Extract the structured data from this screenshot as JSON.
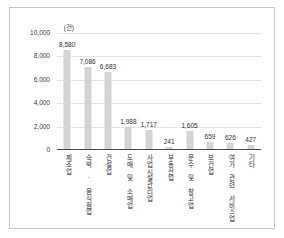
{
  "chart_data": {
    "type": "bar",
    "title": "",
    "subtitle": "",
    "xlabel": "",
    "ylabel": "",
    "unit_label": "(건)",
    "ylim": [
      0,
      10000
    ],
    "ytick_labels": [
      "10,000",
      "8,000",
      "6,000",
      "4,000",
      "2,000",
      "0"
    ],
    "ytick_values": [
      10000,
      8000,
      6000,
      4000,
      2000,
      0
    ],
    "grid": true,
    "legend": false,
    "bar_color": "#d4d4d4",
    "categories": [
      "제조업",
      "숙박 · 음식점업",
      "건설업",
      "도매 및 소매업",
      "사업시설관리업",
      "부동산업",
      "운수 및 창고업",
      "보건업",
      "여가 관련 서비스업",
      "기타"
    ],
    "values": [
      8580,
      7086,
      6683,
      1988,
      1717,
      241,
      1605,
      659,
      626,
      427
    ],
    "value_labels": [
      "8,580",
      "7,086",
      "6,683",
      "1,988",
      "1,717",
      "241",
      "1,605",
      "659",
      "626",
      "427"
    ]
  }
}
